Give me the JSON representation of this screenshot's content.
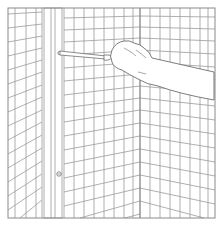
{
  "figure": {
    "style": "monochrome line art",
    "colors": {
      "background": "#ffffff",
      "line": "#9a9a9a",
      "line_dark": "#6e6e6e",
      "skin_fill": "#ffffff"
    },
    "elements": {
      "frame": "square border",
      "left_wall": "tiled panel, grid slopes down to the left",
      "trim_strip": "vertical trim strip with one screw",
      "back_wall": "tiled panel",
      "corner": "inside corner of two tiled walls",
      "right_wall": "tiled panel, grid slopes down to the right",
      "hand": "hand gripping screwdriver",
      "screwdriver": "screwdriver pointing left at trim strip",
      "screw": "screw head on trim strip"
    }
  }
}
